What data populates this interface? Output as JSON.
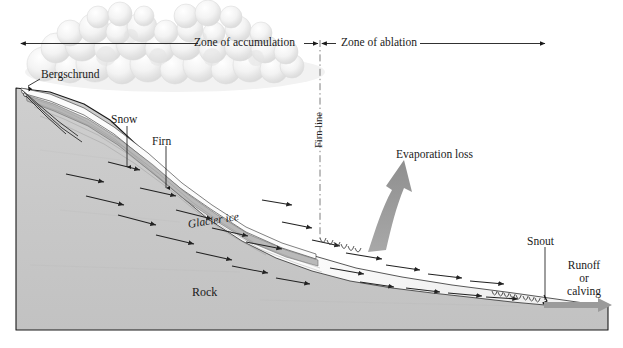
{
  "figure": {
    "type": "cross-section-diagram",
    "cropped_top_text": "· · · · · · ·"
  },
  "zones": {
    "accumulation": {
      "label": "Zone of accumulation",
      "arrow_start_x": 20,
      "arrow_end_x": 320
    },
    "ablation": {
      "label": "Zone of ablation",
      "arrow_start_x": 320,
      "arrow_end_x": 546
    },
    "divider": {
      "label": "Firn line",
      "x": 320,
      "y_top": 43,
      "y_bottom": 240,
      "style": "dash-dot"
    }
  },
  "features": [
    {
      "name": "bergschrund",
      "label": "Bergschrund",
      "x": 40,
      "y": 68
    },
    {
      "name": "snow",
      "label": "Snow",
      "x": 112,
      "y": 114
    },
    {
      "name": "firn",
      "label": "Firn",
      "x": 152,
      "y": 135
    },
    {
      "name": "glacier-ice",
      "label": "Glacier ice",
      "x": 188,
      "y": 218,
      "italic": true
    },
    {
      "name": "rock",
      "label": "Rock",
      "x": 193,
      "y": 287
    },
    {
      "name": "evaporation-loss",
      "label": "Evaporation loss",
      "x": 396,
      "y": 149
    },
    {
      "name": "snout",
      "label": "Snout",
      "x": 528,
      "y": 236
    },
    {
      "name": "runoff-or-calving",
      "label": "Runoff\nor\ncalving",
      "line1": "Runoff",
      "line2": "or",
      "line3": "calving",
      "x": 557,
      "y": 260
    }
  ],
  "colors": {
    "rock_fill": "#c6c6c6",
    "rock_stroke": "#1a1a1a",
    "ice_fill": "#fdfdfd",
    "firn_fill": "#b9b9b9",
    "snow_fill": "#f4f4f4",
    "cloud_fill": "#ededed",
    "cloud_stroke": "#d2d2d2",
    "gray_arrow": "#9a9a9a",
    "flow_arrow": "#222222",
    "text": "#1a1a1a",
    "background": "#ffffff"
  },
  "counts": {
    "flow_arrows": 24,
    "crevasse_clusters": 3,
    "cloud_lobes": 41
  }
}
